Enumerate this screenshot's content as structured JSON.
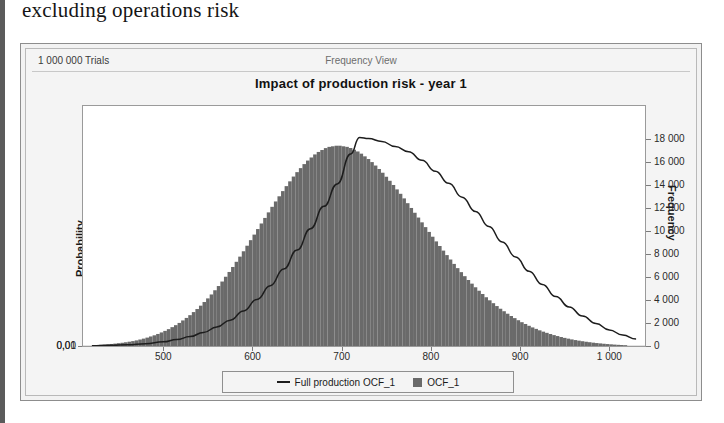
{
  "page": {
    "heading": "excluding operations risk"
  },
  "panel": {
    "trials": "1 000 000 Trials",
    "view_mode": "Frequency View",
    "title": "Impact of production risk - year 1"
  },
  "legend": {
    "items": [
      {
        "label": "Full production OCF_1",
        "marker": "line",
        "color": "#1d1d1d"
      },
      {
        "label": "OCF_1",
        "marker": "square",
        "color": "#6a6a6a"
      }
    ]
  },
  "colors": {
    "histogram_fill": "#6a6a6a",
    "line": "#1d1d1d",
    "grid": "#c9c9c9",
    "plot_background": "#ffffff",
    "panel_background": "#f2f2f2"
  },
  "chart_data": {
    "type": "histogram",
    "title": "Impact of production risk - year 1",
    "subtitle": "1 000 000 Trials",
    "view": "Frequency View",
    "xlabel": "",
    "ylabel": "Probability",
    "y2label": "Frequency",
    "xlim": [
      410,
      1040
    ],
    "ylim": [
      0,
      10440
    ],
    "y2lim": [
      0,
      20880
    ],
    "grid": true,
    "gridlines_y": [
      0.01
    ],
    "legend_position": "bottom-center",
    "x_ticks": [
      500,
      600,
      700,
      800,
      900,
      1000
    ],
    "x_tick_labels": [
      "500",
      "600",
      "700",
      "800",
      "900",
      "1 000"
    ],
    "y_left_ticks": [
      0,
      0.01
    ],
    "y_left_tick_labels": [
      "0,00",
      "0,01"
    ],
    "y_right_ticks": [
      0,
      2000,
      4000,
      6000,
      8000,
      10000,
      12000,
      14000,
      16000,
      18000
    ],
    "y_right_tick_labels": [
      "0",
      "2 000",
      "4 000",
      "6 000",
      "8 000",
      "10 000",
      "12 000",
      "14 000",
      "16 000",
      "18 000"
    ],
    "series": [
      {
        "name": "OCF_1",
        "type": "bar",
        "color": "#6a6a6a",
        "axis": "y2",
        "x": [
          420,
          432,
          444,
          456,
          468,
          480,
          492,
          504,
          516,
          528,
          540,
          552,
          564,
          576,
          588,
          600,
          612,
          624,
          636,
          648,
          660,
          672,
          684,
          696,
          708,
          720,
          732,
          744,
          756,
          768,
          780,
          792,
          804,
          816,
          828,
          840,
          852,
          864,
          876,
          888,
          900,
          912,
          924,
          936,
          948,
          960,
          972,
          984,
          996,
          1008,
          1020
        ],
        "values": [
          60,
          110,
          190,
          300,
          450,
          680,
          980,
          1380,
          1900,
          2550,
          3350,
          4300,
          5400,
          6650,
          8000,
          9450,
          10900,
          12350,
          13700,
          14950,
          16000,
          16800,
          17300,
          17450,
          17300,
          16850,
          16150,
          15250,
          14200,
          13050,
          11800,
          10550,
          9300,
          8100,
          6950,
          5900,
          4950,
          4100,
          3350,
          2700,
          2150,
          1680,
          1300,
          990,
          740,
          540,
          390,
          270,
          180,
          110,
          60
        ]
      },
      {
        "name": "Full production OCF_1",
        "type": "line",
        "color": "#1d1d1d",
        "axis": "y2",
        "x": [
          420,
          440,
          460,
          480,
          500,
          515,
          530,
          545,
          560,
          575,
          590,
          605,
          620,
          635,
          650,
          665,
          680,
          695,
          710,
          720,
          730,
          745,
          760,
          775,
          790,
          805,
          820,
          835,
          850,
          865,
          880,
          895,
          910,
          925,
          940,
          955,
          970,
          985,
          1000,
          1015,
          1030
        ],
        "values": [
          30,
          60,
          110,
          200,
          360,
          560,
          820,
          1180,
          1650,
          2250,
          3050,
          4050,
          5250,
          6700,
          8350,
          10200,
          12150,
          14100,
          16700,
          18150,
          18050,
          17800,
          17350,
          16900,
          16150,
          15200,
          14150,
          12950,
          11700,
          10400,
          9050,
          7750,
          6500,
          5350,
          4300,
          3400,
          2600,
          1950,
          1400,
          950,
          600
        ]
      }
    ]
  }
}
